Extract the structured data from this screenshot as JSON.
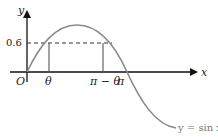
{
  "diagram": {
    "axis_x_label": "x",
    "axis_y_label": "y",
    "origin_label": "O",
    "y_tick_label": "0.6",
    "x_tick_labels": [
      "θ",
      "π − θ",
      "π"
    ],
    "curve_label": "y = sin x",
    "colors": {
      "curve": "#8a8a8a",
      "axes": "#111111",
      "guides": "#555555"
    }
  }
}
